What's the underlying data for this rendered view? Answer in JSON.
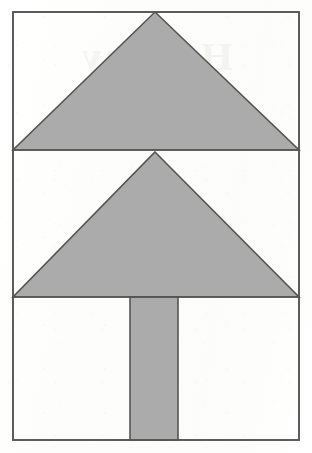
{
  "document": {
    "title": "Geometric figure: stacked triangles over rectangle",
    "background_color": "#fdfdfc",
    "watermark_text": "Holiday"
  },
  "figure": {
    "name": "tree-pyramid-figure",
    "fill_color": "#ababab",
    "stroke_color": "#555555",
    "stroke_width": 1.6,
    "frame": {
      "label": "outer-rectangle",
      "x": 13,
      "y": 12,
      "width": 286,
      "height": 428
    },
    "dividers": [
      {
        "label": "divider-upper",
        "y": 150,
        "x1": 13,
        "x2": 299
      },
      {
        "label": "divider-lower",
        "y": 297,
        "x1": 13,
        "x2": 299
      }
    ],
    "shapes": [
      {
        "label": "upper-triangle",
        "type": "triangle",
        "points": "155,12 299,150 13,150",
        "filled": true
      },
      {
        "label": "lower-triangle",
        "type": "triangle",
        "points": "155,152 299,297 13,297",
        "filled": true
      },
      {
        "label": "trunk-rectangle",
        "type": "rect",
        "x": 130,
        "y": 297,
        "width": 48,
        "height": 143,
        "filled": true
      }
    ]
  }
}
